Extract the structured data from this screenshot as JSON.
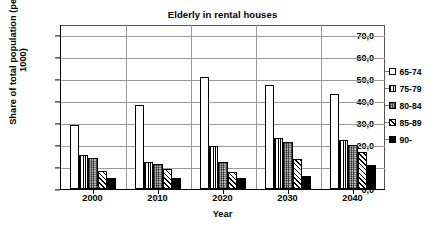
{
  "chart_data": {
    "type": "bar",
    "title": "Elderly in rental houses",
    "xlabel": "Year",
    "ylabel": "Share of total population (per 1000)",
    "ylabel_line1": "Share of total population (per",
    "ylabel_line2": "1000)",
    "categories": [
      "2000",
      "2010",
      "2020",
      "2030",
      "2040"
    ],
    "ylim": [
      0,
      75
    ],
    "yticks": [
      0,
      10,
      20,
      30,
      40,
      50,
      60,
      70
    ],
    "ytick_labels": [
      "0,0",
      "10,0",
      "20,0",
      "30,0",
      "40,0",
      "50,0",
      "60,0",
      "70,0"
    ],
    "grid": true,
    "legend_position": "right",
    "series": [
      {
        "name": "65-74",
        "pattern": "white",
        "values": [
          29.3,
          38.1,
          50.7,
          47.1,
          43.1
        ]
      },
      {
        "name": "75-79",
        "pattern": "dotted-vert",
        "values": [
          15.4,
          12.2,
          19.7,
          23.4,
          22.2
        ]
      },
      {
        "name": "80-84",
        "pattern": "gray-dots",
        "values": [
          14.1,
          11.3,
          12.3,
          21.2,
          20.1
        ]
      },
      {
        "name": "85-89",
        "pattern": "diagonal",
        "values": [
          8.3,
          9.1,
          7.8,
          13.6,
          16.6
        ]
      },
      {
        "name": "90-",
        "pattern": "solid-black",
        "values": [
          5.1,
          5.0,
          4.9,
          6.1,
          10.9
        ]
      }
    ]
  }
}
